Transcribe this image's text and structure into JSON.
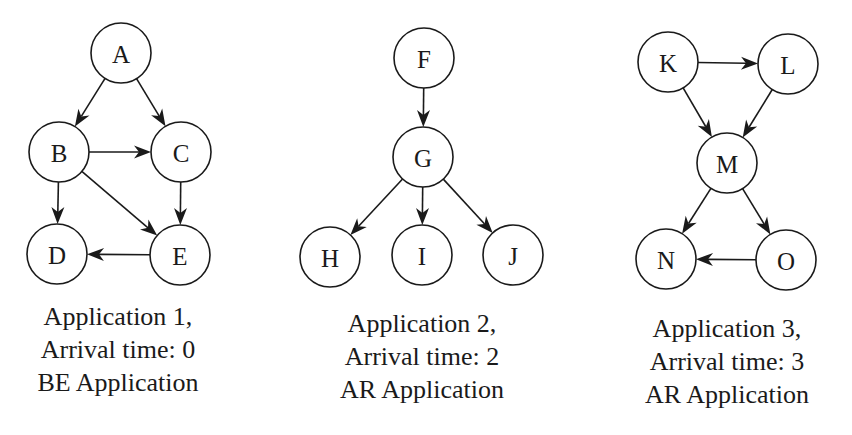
{
  "diagram": {
    "node_radius": 30,
    "stroke_color": "#1a1a1a",
    "background": "#ffffff"
  },
  "applications": [
    {
      "id": "app1",
      "caption": {
        "line1": "Application 1,",
        "line2": "Arrival time: 0",
        "line3": "BE Application"
      },
      "arrival_time": 0,
      "type": "BE",
      "caption_center_x": 118,
      "caption_top": 300,
      "nodes": [
        {
          "id": "A",
          "label": "A",
          "x": 121,
          "y": 53
        },
        {
          "id": "B",
          "label": "B",
          "x": 59,
          "y": 152
        },
        {
          "id": "C",
          "label": "C",
          "x": 181,
          "y": 152
        },
        {
          "id": "D",
          "label": "D",
          "x": 57,
          "y": 254
        },
        {
          "id": "E",
          "label": "E",
          "x": 180,
          "y": 255
        }
      ],
      "edges": [
        {
          "from": "A",
          "to": "B"
        },
        {
          "from": "A",
          "to": "C"
        },
        {
          "from": "B",
          "to": "C"
        },
        {
          "from": "B",
          "to": "D"
        },
        {
          "from": "B",
          "to": "E"
        },
        {
          "from": "C",
          "to": "E"
        },
        {
          "from": "E",
          "to": "D"
        }
      ]
    },
    {
      "id": "app2",
      "caption": {
        "line1": "Application 2,",
        "line2": "Arrival time: 2",
        "line3": "AR Application"
      },
      "arrival_time": 2,
      "type": "AR",
      "caption_center_x": 422,
      "caption_top": 307,
      "nodes": [
        {
          "id": "F",
          "label": "F",
          "x": 424,
          "y": 58
        },
        {
          "id": "G",
          "label": "G",
          "x": 423,
          "y": 157
        },
        {
          "id": "H",
          "label": "H",
          "x": 330,
          "y": 257
        },
        {
          "id": "I",
          "label": "I",
          "x": 422,
          "y": 255
        },
        {
          "id": "J",
          "label": "J",
          "x": 513,
          "y": 255
        }
      ],
      "edges": [
        {
          "from": "F",
          "to": "G"
        },
        {
          "from": "G",
          "to": "H"
        },
        {
          "from": "G",
          "to": "I"
        },
        {
          "from": "G",
          "to": "J"
        }
      ]
    },
    {
      "id": "app3",
      "caption": {
        "line1": "Application 3,",
        "line2": "Arrival time: 3",
        "line3": "AR Application"
      },
      "arrival_time": 3,
      "type": "AR",
      "caption_center_x": 727,
      "caption_top": 312,
      "nodes": [
        {
          "id": "K",
          "label": "K",
          "x": 668,
          "y": 62
        },
        {
          "id": "L",
          "label": "L",
          "x": 788,
          "y": 64
        },
        {
          "id": "M",
          "label": "M",
          "x": 727,
          "y": 163
        },
        {
          "id": "N",
          "label": "N",
          "x": 666,
          "y": 259
        },
        {
          "id": "O",
          "label": "O",
          "x": 786,
          "y": 260
        }
      ],
      "edges": [
        {
          "from": "K",
          "to": "L"
        },
        {
          "from": "K",
          "to": "M"
        },
        {
          "from": "L",
          "to": "M"
        },
        {
          "from": "M",
          "to": "N"
        },
        {
          "from": "M",
          "to": "O"
        },
        {
          "from": "O",
          "to": "N"
        }
      ]
    }
  ]
}
